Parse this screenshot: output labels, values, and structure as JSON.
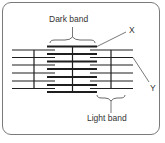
{
  "diagram": {
    "labels": {
      "dark_band": "Dark band",
      "light_band": "Light band",
      "x": "X",
      "y": "Y"
    },
    "colors": {
      "line": "#1e1e1e",
      "leader": "#555555",
      "border": "#7a7a7a"
    }
  }
}
